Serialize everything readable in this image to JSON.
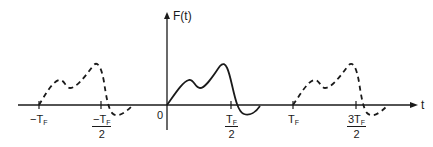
{
  "diagram": {
    "type": "periodic-waveform",
    "y_axis_label": "F(t)",
    "x_axis_label": "t",
    "origin_label": "0",
    "ticks": [
      {
        "id": "neg_tf",
        "main": "−T",
        "sub": "F",
        "denominator": null
      },
      {
        "id": "neg_half_tf",
        "main": "−T",
        "sub": "F",
        "denominator": "2"
      },
      {
        "id": "half_tf",
        "main": "T",
        "sub": "F",
        "denominator": "2"
      },
      {
        "id": "tf",
        "main": "T",
        "sub": "F",
        "denominator": null
      },
      {
        "id": "three_half_tf",
        "main": "3T",
        "sub": "F",
        "denominator": "2"
      }
    ],
    "curves": [
      {
        "name": "previous-period",
        "style": "dashed",
        "range": "[-T_F, -T_F/2]"
      },
      {
        "name": "primary-period",
        "style": "solid",
        "range": "[0, T_F/2]"
      },
      {
        "name": "next-period",
        "style": "dashed",
        "range": "[T_F, 3T_F/2]"
      }
    ],
    "colors": {
      "ink": "#1a1a1a",
      "background": "#ffffff"
    }
  }
}
